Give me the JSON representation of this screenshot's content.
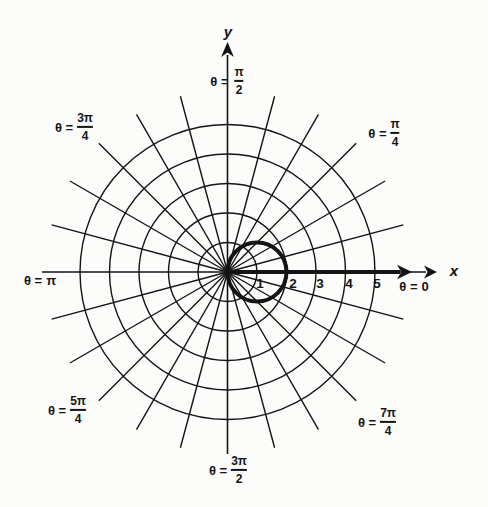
{
  "figure": {
    "background": "#fcfcfb",
    "ink": "#141414"
  },
  "chart_data": {
    "type": "line",
    "coordinate_system": "polar",
    "title": "",
    "xlabel": "x",
    "ylabel": "y",
    "r_range": [
      0,
      5
    ],
    "grid": "on",
    "rings": [
      1,
      2,
      3,
      4,
      5
    ],
    "radial_tick_labels": [
      "1",
      "2",
      "3",
      "4",
      "5"
    ],
    "spoke_step_degrees": 15,
    "spoke_extent_r_units": 6.15,
    "axes": {
      "x_label": "x",
      "y_label": "y",
      "bold_polar_axis_ray": true
    },
    "angle_labels": [
      {
        "angle_degrees": 90,
        "prefix": "θ =",
        "frac": {
          "num": "π",
          "den": "2"
        }
      },
      {
        "angle_degrees": 135,
        "prefix": "θ =",
        "frac": {
          "num": "3π",
          "den": "4"
        }
      },
      {
        "angle_degrees": 45,
        "prefix": "θ =",
        "frac": {
          "num": "π",
          "den": "4"
        }
      },
      {
        "angle_degrees": 180,
        "prefix": "θ =",
        "value": "π"
      },
      {
        "angle_degrees": 0,
        "prefix": "θ =",
        "value": "0"
      },
      {
        "angle_degrees": 225,
        "prefix": "θ =",
        "frac": {
          "num": "5π",
          "den": "4"
        }
      },
      {
        "angle_degrees": 315,
        "prefix": "θ =",
        "frac": {
          "num": "7π",
          "den": "4"
        }
      },
      {
        "angle_degrees": 270,
        "prefix": "θ =",
        "frac": {
          "num": "3π",
          "den": "2"
        }
      }
    ],
    "curve": {
      "shape": "circle",
      "center_units": [
        1,
        0
      ],
      "radius_units": 1,
      "stroke_weight": "bold",
      "passes_through_units": [
        [
          0,
          0
        ],
        [
          2,
          0
        ]
      ]
    }
  }
}
